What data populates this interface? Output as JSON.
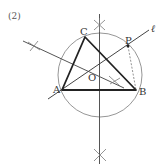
{
  "problem_label": "(2)",
  "points": {
    "A": "A",
    "B": "B",
    "C": "C",
    "O": "O",
    "P": "P"
  },
  "line_label": "ℓ",
  "colors": {
    "stroke": "#333333",
    "circle": "#888888",
    "background": "#ffffff"
  }
}
